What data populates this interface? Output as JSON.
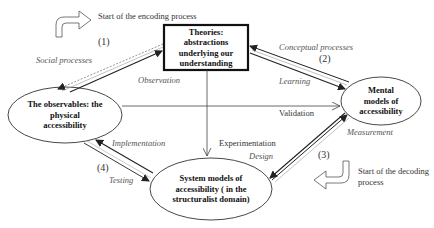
{
  "nodes": {
    "theories": {
      "lines": [
        "Theories:",
        "abstractions",
        "underlying our",
        "understanding"
      ]
    },
    "observables": {
      "lines": [
        "The observables: the",
        "physical",
        "accessibility"
      ]
    },
    "mental_models": {
      "lines": [
        "Mental",
        "models of",
        "accessibility"
      ]
    },
    "system_models": {
      "lines": [
        "System models of",
        "accessibility ( in the",
        "structuralist domain)"
      ]
    }
  },
  "annotations": {
    "encoding_start": "Start of the encoding process",
    "decoding_start_line1": "Start of the decoding",
    "decoding_start_line2": "process"
  },
  "edges": {
    "social_processes": "Social processes",
    "observation": "Observation",
    "conceptual_processes": "Conceptual processes",
    "learning": "Learning",
    "validation": "Validation",
    "measurement": "Measurement",
    "experimentation": "Experimentation",
    "design": "Design",
    "implementation": "Implementation",
    "testing": "Testing"
  },
  "process_numbers": {
    "one": "(1)",
    "two": "(2)",
    "three": "(3)",
    "four": "(4)"
  },
  "colors": {
    "line": "#333333",
    "dashed": "#777777",
    "text": "#222222",
    "italic": "#555555"
  }
}
